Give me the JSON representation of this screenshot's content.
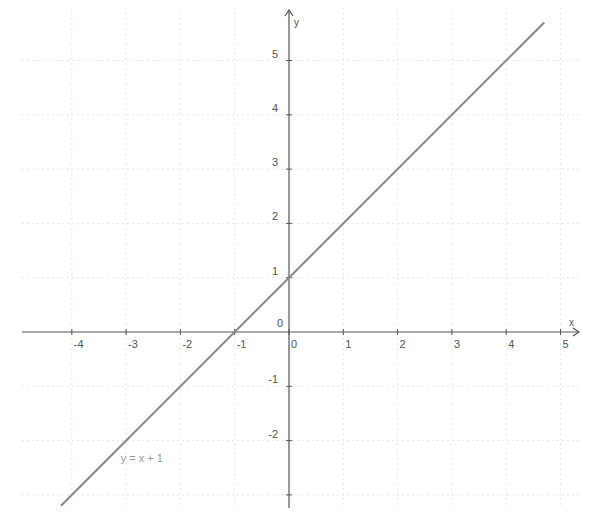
{
  "chart_data": {
    "type": "line",
    "title": "",
    "xlabel": "x",
    "ylabel": "y",
    "xlim": [
      -4.5,
      4.9
    ],
    "ylim": [
      -3.2,
      5.9
    ],
    "grid": true,
    "x_ticks": [
      -4,
      -3,
      -2,
      -1,
      0,
      1,
      2,
      3,
      4,
      5
    ],
    "y_ticks": [
      -2,
      -1,
      0,
      1,
      2,
      3,
      4,
      5
    ],
    "x_tick_labels": [
      "-4",
      "-3",
      "-2",
      "-1",
      "0",
      "1",
      "2",
      "3",
      "4",
      "5"
    ],
    "y_tick_labels": [
      "-2",
      "-1",
      "0",
      "1",
      "2",
      "3",
      "4",
      "5"
    ],
    "series": [
      {
        "name": "y = x + 1",
        "equation": "y = x + 1",
        "x": [
          -4.2,
          4.7
        ],
        "y": [
          -3.2,
          5.7
        ],
        "color": "#888888"
      }
    ],
    "annotations": [
      {
        "text": "y = x + 1",
        "x": -3.1,
        "y": -2.4
      }
    ],
    "legend": "none"
  },
  "colors": {
    "axis": "#555555",
    "grid": "#e6e6e6",
    "line": "#888888",
    "label": "#9a9a9a"
  },
  "geometry": {
    "origin_px": [
      289,
      332
    ],
    "unit_px": 54.3
  }
}
